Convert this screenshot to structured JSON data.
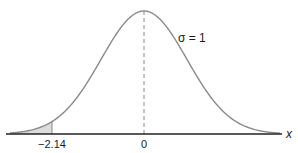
{
  "figure": {
    "type": "normal-distribution-curve",
    "mean_label": "0",
    "cutoff_label": "−2.14",
    "cutoff_value": -2.14,
    "sigma_label": "σ = 1",
    "axis_label": "x",
    "shaded_region": "left tail below -2.14",
    "colors": {
      "curve": "#8a8a8a",
      "axis": "#222222",
      "shade": "#dcdcdc",
      "mean_line": "#8a8a8a"
    }
  }
}
